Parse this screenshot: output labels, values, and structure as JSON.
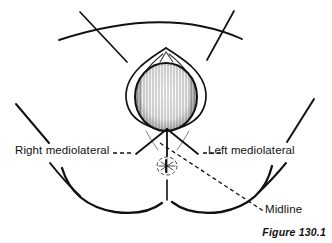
{
  "figure": {
    "caption": "Figure 130.1",
    "background_color": "#ffffff",
    "ink_color": "#111111"
  },
  "labels": {
    "right_mediolateral": "Right mediolateral",
    "left_mediolateral": "Left mediolateral",
    "midline": "Midline"
  },
  "annotations": [
    {
      "name": "right-mediolateral",
      "text": "Right mediolateral",
      "leader_style": "dashed",
      "incision_style": "solid",
      "direction": "down-left-from-fourchette"
    },
    {
      "name": "left-mediolateral",
      "text": "Left mediolateral",
      "leader_style": "dashed",
      "incision_style": "solid",
      "direction": "down-right-from-fourchette"
    },
    {
      "name": "midline",
      "text": "Midline",
      "leader_style": "dashed",
      "incision_style": "solid",
      "direction": "straight-down-from-fourchette"
    }
  ],
  "drawing_parts": [
    "abdomen-arc",
    "left-thigh-line",
    "right-thigh-line",
    "left-buttock-curve",
    "right-buttock-curve",
    "vulva-outline",
    "fetal-head-crowning",
    "anus",
    "incision-lines"
  ]
}
